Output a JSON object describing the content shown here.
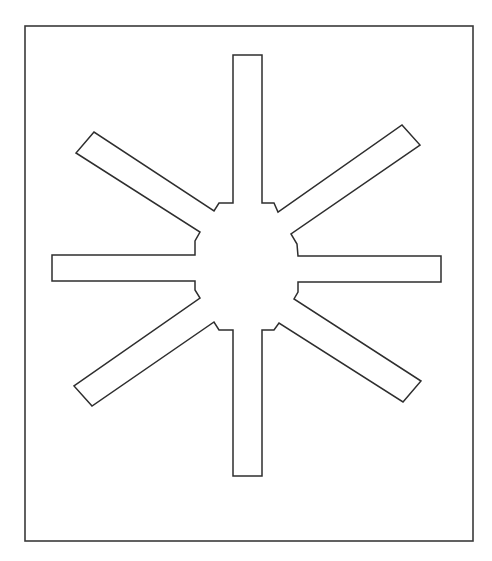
{
  "diagram": {
    "type": "outline-drawing",
    "colors": {
      "background": "#ffffff",
      "stroke": "#2e2e2e",
      "frame_stroke": "#3a3a3a"
    },
    "frame": {
      "x": 25,
      "y": 26,
      "width": 448,
      "height": 515
    },
    "arm_count": 8,
    "arms": [
      {
        "name": "top",
        "direction": "up"
      },
      {
        "name": "upper-right",
        "direction": "up-right"
      },
      {
        "name": "right",
        "direction": "right"
      },
      {
        "name": "lower-right",
        "direction": "down-right"
      },
      {
        "name": "bottom",
        "direction": "down"
      },
      {
        "name": "lower-left",
        "direction": "down-left"
      },
      {
        "name": "left",
        "direction": "left"
      },
      {
        "name": "upper-left",
        "direction": "up-left"
      }
    ],
    "outline_points": "233,55 262,55 262,203 274,203 278,212 402,125 420,145 291,234 297,244 298,256 441,256 441,282 298,282 298,292 294,299 421,381 403,402 279,323 274,330 262,330 262,476 233,476 233,330 219,330 214,322 92,406 74,386 200,298 195,290 195,281 52,281 52,255 195,255 195,241 200,232 76,153 94,132 214,211 219,203 233,203"
  }
}
